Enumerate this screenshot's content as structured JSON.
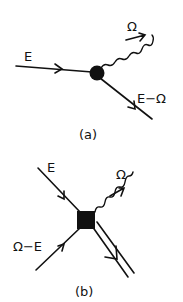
{
  "figure": {
    "panels": [
      {
        "id": "a",
        "caption": "(a)",
        "vertex": "filled-circle",
        "lines": [
          {
            "label": "E",
            "kind": "fermion",
            "direction": "incoming"
          },
          {
            "label": "Ω",
            "kind": "photon",
            "direction": "outgoing"
          },
          {
            "label": "E−Ω",
            "kind": "fermion",
            "direction": "outgoing"
          }
        ]
      },
      {
        "id": "b",
        "caption": "(b)",
        "vertex": "filled-square",
        "lines": [
          {
            "label": "E",
            "kind": "fermion",
            "direction": "incoming"
          },
          {
            "label": "Ω−E",
            "kind": "fermion",
            "direction": "incoming"
          },
          {
            "label": "Ω",
            "kind": "photon",
            "direction": "outgoing"
          },
          {
            "label": "",
            "kind": "double-line",
            "direction": "outgoing"
          }
        ]
      }
    ]
  },
  "colors": {
    "ink": "#111111",
    "background": "#ffffff"
  }
}
